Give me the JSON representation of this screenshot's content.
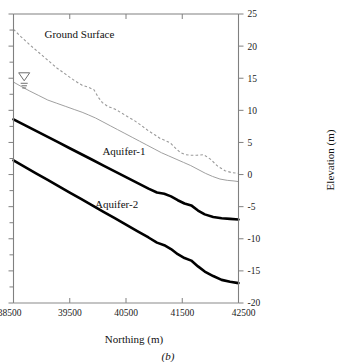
{
  "figure": {
    "caption": "(b)",
    "panel_id": "b"
  },
  "chart_data": {
    "type": "line",
    "title": "",
    "xlabel": "Northing (m)",
    "ylabel": "Elevation (m)",
    "xlim": [
      38500,
      42500
    ],
    "ylim": [
      -20,
      25
    ],
    "xticks": [
      38500,
      39500,
      40500,
      41500,
      42500
    ],
    "xtick_labels": [
      "38500",
      "39500",
      "40500",
      "41500",
      "42500"
    ],
    "yticks": [
      -20,
      -15,
      -10,
      -5,
      0,
      5,
      10,
      15,
      20,
      25
    ],
    "ytick_labels": [
      "-20",
      "-15",
      "-10",
      "-5",
      "0",
      "5",
      "10",
      "15",
      "20",
      "25"
    ],
    "y_minor_ticks_left": [
      -17.5,
      -12.5,
      -7.5,
      -2.5,
      2.5,
      7.5,
      12.5,
      17.5,
      22.5
    ],
    "grid": false,
    "legend": "none",
    "annotations": [
      {
        "text": "Ground Surface",
        "x": 39050,
        "y": 21.2,
        "name": "ground-surface-label"
      },
      {
        "text": "Aquifer-1",
        "x": 40080,
        "y": 3.0,
        "name": "aquifer-1-label"
      },
      {
        "text": "Aquifer-2",
        "x": 39950,
        "y": -5.2,
        "name": "aquifer-2-label"
      },
      {
        "text": "water-table-symbol",
        "x": 38690,
        "y": 14.6,
        "name": "water-table-symbol"
      }
    ],
    "series": [
      {
        "name": "Ground Surface",
        "style": "dashed",
        "color": "#9a9a9a",
        "x": [
          38500,
          38640,
          38790,
          38950,
          39110,
          39270,
          39430,
          39590,
          39720,
          39830,
          39930,
          40010,
          40080,
          40180,
          40300,
          40420,
          40530,
          40650,
          40780,
          40900,
          41010,
          41110,
          41200,
          41290,
          41380,
          41470,
          41560,
          41650,
          41760,
          41880,
          42000,
          42130,
          42260,
          42380,
          42500
        ],
        "y": [
          22.6,
          21.4,
          20.2,
          19.0,
          17.8,
          16.6,
          15.6,
          14.6,
          13.9,
          13.6,
          13.2,
          12.0,
          11.2,
          10.6,
          10.2,
          9.6,
          9.0,
          8.4,
          7.6,
          6.8,
          6.2,
          5.6,
          5.3,
          4.9,
          4.1,
          3.4,
          3.1,
          3.0,
          3.0,
          3.1,
          2.4,
          1.3,
          0.6,
          0.3,
          0.2
        ]
      },
      {
        "name": "Water Table",
        "style": "solid-thin",
        "color": "#a0a0a0",
        "x": [
          38500,
          38640,
          38790,
          38950,
          39110,
          39270,
          39430,
          39590,
          39720,
          39830,
          39960,
          40090,
          40220,
          40350,
          40480,
          40610,
          40740,
          40870,
          41000,
          41130,
          41260,
          41390,
          41520,
          41650,
          41780,
          41910,
          42040,
          42170,
          42300,
          42420,
          42500
        ],
        "y": [
          14.4,
          13.7,
          13.0,
          12.3,
          11.6,
          11.1,
          10.6,
          10.1,
          9.7,
          9.3,
          8.8,
          8.2,
          7.6,
          7.0,
          6.4,
          5.8,
          5.2,
          4.6,
          4.0,
          3.4,
          2.9,
          2.4,
          1.9,
          1.4,
          0.8,
          0.2,
          -0.3,
          -0.7,
          -0.9,
          -1.0,
          -1.1
        ]
      },
      {
        "name": "Aquifer-1",
        "style": "solid-thick",
        "color": "#000000",
        "x": [
          38500,
          38700,
          38900,
          39100,
          39300,
          39500,
          39700,
          39900,
          40100,
          40300,
          40500,
          40700,
          40900,
          41050,
          41180,
          41300,
          41420,
          41540,
          41660,
          41780,
          41900,
          42050,
          42200,
          42350,
          42500
        ],
        "y": [
          8.6,
          7.7,
          6.8,
          5.9,
          5.0,
          4.1,
          3.2,
          2.3,
          1.4,
          0.5,
          -0.4,
          -1.3,
          -2.2,
          -2.8,
          -3.0,
          -3.4,
          -4.0,
          -4.5,
          -4.8,
          -5.6,
          -6.2,
          -6.6,
          -6.8,
          -6.9,
          -7.0
        ]
      },
      {
        "name": "Aquifer-2",
        "style": "solid-thick",
        "color": "#000000",
        "x": [
          38500,
          38700,
          38900,
          39100,
          39300,
          39500,
          39700,
          39900,
          40100,
          40300,
          40500,
          40700,
          40900,
          41050,
          41180,
          41300,
          41420,
          41540,
          41660,
          41780,
          41900,
          42050,
          42200,
          42350,
          42500
        ],
        "y": [
          2.2,
          1.2,
          0.2,
          -0.8,
          -1.8,
          -2.8,
          -3.8,
          -4.8,
          -5.8,
          -6.8,
          -7.8,
          -8.8,
          -9.8,
          -10.6,
          -11.0,
          -11.6,
          -12.4,
          -13.0,
          -13.4,
          -14.3,
          -15.1,
          -15.8,
          -16.4,
          -16.7,
          -16.9
        ]
      }
    ]
  }
}
